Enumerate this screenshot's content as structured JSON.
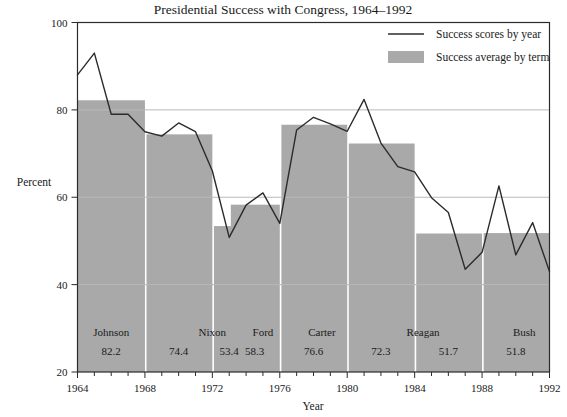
{
  "chart_data": {
    "type": "bar",
    "title": "Presidential Success with Congress, 1964–1992",
    "xlabel": "Year",
    "ylabel": "Percent",
    "ylim": [
      20,
      100
    ],
    "xlim": [
      1964,
      1992
    ],
    "yticks": [
      20,
      40,
      60,
      80,
      100
    ],
    "xticks": [
      1964,
      1968,
      1972,
      1976,
      1980,
      1984,
      1988,
      1992
    ],
    "x_minor_step": 1,
    "grid": "horizontal",
    "legend_position": "top-right",
    "legend": [
      {
        "label": "Success scores by year",
        "marker": "line",
        "color": "#2b2b2b"
      },
      {
        "label": "Success average by term",
        "marker": "swatch",
        "color": "#a9a9a9"
      }
    ],
    "series": [
      {
        "name": "Success scores by year",
        "type": "line",
        "x": [
          1964,
          1965,
          1966,
          1967,
          1968,
          1969,
          1970,
          1971,
          1972,
          1973,
          1974,
          1975,
          1976,
          1977,
          1978,
          1979,
          1980,
          1981,
          1982,
          1983,
          1984,
          1985,
          1986,
          1987,
          1988,
          1989,
          1990,
          1991,
          1992
        ],
        "values": [
          88.0,
          93.0,
          79.0,
          79.0,
          75.0,
          74.0,
          77.0,
          75.0,
          66.0,
          50.8,
          58.2,
          61.0,
          54.0,
          75.4,
          78.3,
          76.8,
          75.1,
          82.4,
          72.4,
          67.0,
          65.8,
          59.9,
          56.5,
          43.5,
          47.4,
          62.6,
          46.8,
          54.2,
          43.0
        ]
      },
      {
        "name": "Success average by term",
        "type": "bar",
        "terms": [
          {
            "president": "Johnson",
            "average": "82.2",
            "value": 82.2,
            "start": 1964,
            "end": 1968
          },
          {
            "president": "Nixon",
            "average": "74.4",
            "value": 74.4,
            "start": 1969,
            "end": 1972
          },
          {
            "president": "",
            "average": "53.4",
            "value": 53.4,
            "start": 1973,
            "end": 1974
          },
          {
            "president": "Ford",
            "average": "58.3",
            "value": 58.3,
            "start": 1974,
            "end": 1976
          },
          {
            "president": "Carter",
            "average": "76.6",
            "value": 76.6,
            "start": 1977,
            "end": 1980
          },
          {
            "president": "Reagan",
            "average": "72.3",
            "value": 72.3,
            "start": 1981,
            "end": 1984
          },
          {
            "president": "",
            "average": "51.7",
            "value": 51.7,
            "start": 1985,
            "end": 1988
          },
          {
            "president": "Bush",
            "average": "51.8",
            "value": 51.8,
            "start": 1989,
            "end": 1992
          }
        ],
        "label_groups": [
          {
            "president": "Johnson",
            "center": 1966.0
          },
          {
            "president": "Nixon",
            "center": 1972.0
          },
          {
            "president": "Ford",
            "center": 1975.0
          },
          {
            "president": "Carter",
            "center": 1978.5
          },
          {
            "president": "Reagan",
            "center": 1984.5
          },
          {
            "president": "Bush",
            "center": 1990.5
          }
        ]
      }
    ],
    "colors": {
      "bar_fill": "#a9a9a9",
      "line": "#2b2b2b",
      "axis": "#2b2b2b",
      "grid": "#b9b9b9",
      "background": "#ffffff"
    }
  }
}
